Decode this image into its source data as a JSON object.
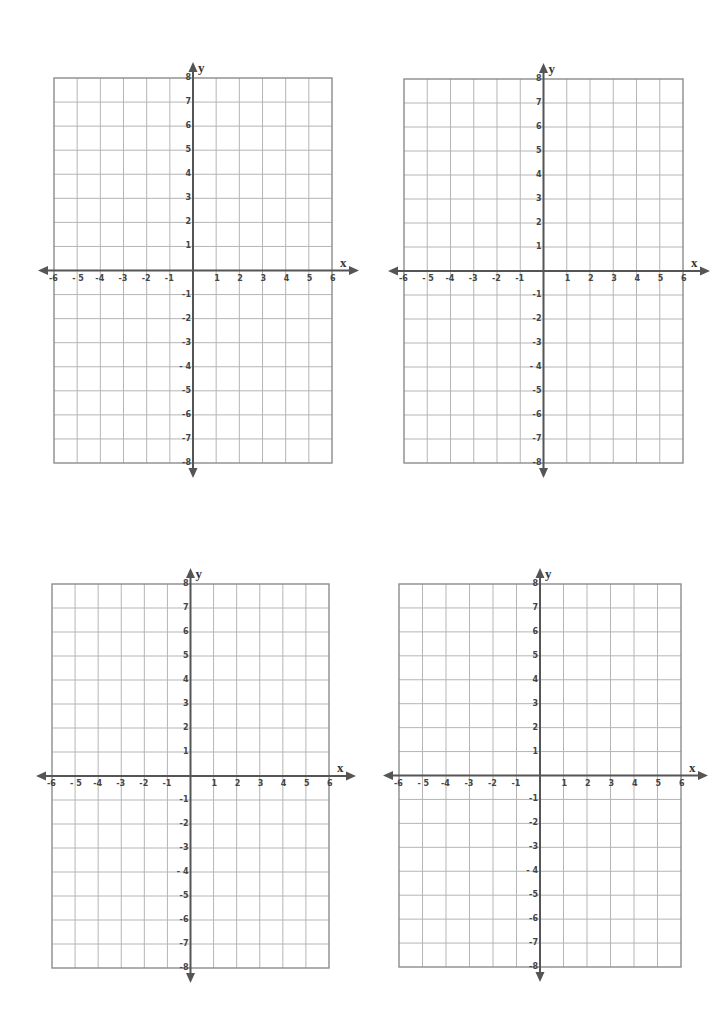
{
  "page": {
    "grid_color": "#b5b5b5",
    "border_color": "#8c8c8c",
    "axis_color": "#555555"
  },
  "axes": {
    "x_name": "x",
    "y_name": "y",
    "x_ticks": [
      "-6",
      "- 5",
      "-4",
      "-3",
      "-2",
      "-1",
      "1",
      "2",
      "3",
      "4",
      "5",
      "6"
    ],
    "x_tick_values": [
      -6,
      -5,
      -4,
      -3,
      -2,
      -1,
      1,
      2,
      3,
      4,
      5,
      6
    ],
    "y_ticks": [
      "8",
      "7",
      "6",
      "5",
      "4",
      "3",
      "2",
      "1",
      "-1",
      "-2",
      "-3",
      "- 4",
      "-5",
      "-6",
      "-7",
      "-8"
    ],
    "y_tick_values": [
      8,
      7,
      6,
      5,
      4,
      3,
      2,
      1,
      -1,
      -2,
      -3,
      -4,
      -5,
      -6,
      -7,
      -8
    ],
    "xlim": [
      -6,
      6
    ],
    "ylim": [
      -8,
      8
    ]
  },
  "graphs": [
    {
      "id": "graph-1",
      "left": 54,
      "top": 78,
      "width": 278,
      "height": 385
    },
    {
      "id": "graph-2",
      "left": 404,
      "top": 79,
      "width": 279,
      "height": 384
    },
    {
      "id": "graph-3",
      "left": 52,
      "top": 584,
      "width": 277,
      "height": 384
    },
    {
      "id": "graph-4",
      "left": 399,
      "top": 584,
      "width": 282,
      "height": 383
    }
  ],
  "chart_data": [
    {
      "type": "scatter",
      "title": "",
      "xlabel": "x",
      "ylabel": "y",
      "xlim": [
        -6,
        6
      ],
      "ylim": [
        -8,
        8
      ],
      "grid": true,
      "series": []
    },
    {
      "type": "scatter",
      "title": "",
      "xlabel": "x",
      "ylabel": "y",
      "xlim": [
        -6,
        6
      ],
      "ylim": [
        -8,
        8
      ],
      "grid": true,
      "series": []
    },
    {
      "type": "scatter",
      "title": "",
      "xlabel": "x",
      "ylabel": "y",
      "xlim": [
        -6,
        6
      ],
      "ylim": [
        -8,
        8
      ],
      "grid": true,
      "series": []
    },
    {
      "type": "scatter",
      "title": "",
      "xlabel": "x",
      "ylabel": "y",
      "xlim": [
        -6,
        6
      ],
      "ylim": [
        -8,
        8
      ],
      "grid": true,
      "series": []
    }
  ]
}
